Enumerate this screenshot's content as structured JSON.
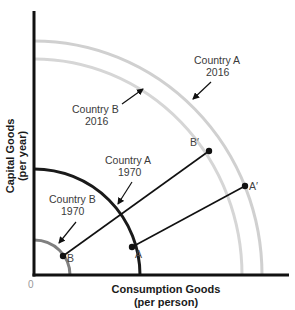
{
  "diagram": {
    "type": "production-possibilities-frontier",
    "x_axis": {
      "label_line1": "Consumption Goods",
      "label_line2": "(per person)"
    },
    "y_axis": {
      "label_line1": "Capital Goods",
      "label_line2": "(per year)"
    },
    "origin_label": "0",
    "curves": [
      {
        "id": "country-b-1970",
        "label_line1": "Country B",
        "label_line2": "1970",
        "color": "#808080"
      },
      {
        "id": "country-a-1970",
        "label_line1": "Country A",
        "label_line2": "1970",
        "color": "#1a1a1a"
      },
      {
        "id": "country-b-2016",
        "label_line1": "Country B",
        "label_line2": "2016",
        "color": "#d4d4d4"
      },
      {
        "id": "country-a-2016",
        "label_line1": "Country A",
        "label_line2": "2016",
        "color": "#cfcfcf"
      }
    ],
    "points": {
      "A": "A",
      "A_prime": "A′",
      "B": "B",
      "B_prime": "B′"
    },
    "colors": {
      "axis": "#111111",
      "growth_path": "#111111"
    }
  }
}
